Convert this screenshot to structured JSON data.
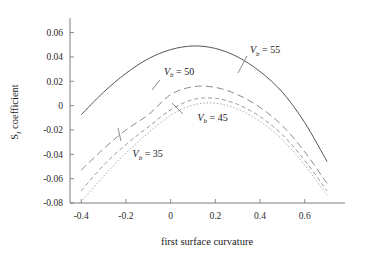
{
  "chart_data": {
    "type": "line",
    "title": "",
    "xlabel": "first surface curvature",
    "ylabel": "S₁ coefficient",
    "xlim": [
      -0.45,
      0.78
    ],
    "ylim": [
      -0.08,
      0.072
    ],
    "xticks": [
      -0.4,
      -0.2,
      0,
      0.2,
      0.4,
      0.6
    ],
    "yticks": [
      0.06,
      0.04,
      0.02,
      0,
      -0.02,
      -0.04,
      -0.06,
      -0.08
    ],
    "xticklabels": [
      "-0.4",
      "-0.2",
      "0",
      "0.2",
      "0.4",
      "0.6"
    ],
    "yticklabels": [
      "0.06",
      "0.04",
      "0.02",
      "0",
      "-0.02",
      "-0.04",
      "-0.06",
      "-0.08"
    ],
    "grid": false,
    "legend": "inline-annotations",
    "series": [
      {
        "name": "Vb = 55",
        "style": "solid",
        "color": "#555555",
        "x": [
          -0.4,
          -0.3,
          -0.2,
          -0.1,
          0.0,
          0.1,
          0.2,
          0.3,
          0.4,
          0.5,
          0.6,
          0.7
        ],
        "y": [
          -0.0075,
          0.011,
          0.0265,
          0.0385,
          0.046,
          0.049,
          0.047,
          0.04,
          0.028,
          0.011,
          -0.014,
          -0.046
        ]
      },
      {
        "name": "Vb = 50",
        "style": "long-dash",
        "color": "#8a8a8a",
        "x": [
          -0.4,
          -0.3,
          -0.2,
          -0.1,
          0.0,
          0.1,
          0.2,
          0.3,
          0.4,
          0.5,
          0.6,
          0.7
        ],
        "y": [
          -0.053,
          -0.0355,
          -0.02,
          -0.0075,
          0.009,
          0.0155,
          0.015,
          0.009,
          -0.0015,
          -0.0165,
          -0.038,
          -0.064
        ]
      },
      {
        "name": "Vb = 45",
        "style": "short-dash",
        "color": "#9a9a9a",
        "x": [
          -0.4,
          -0.3,
          -0.2,
          -0.1,
          0.0,
          0.1,
          0.2,
          0.3,
          0.4,
          0.5,
          0.6,
          0.7
        ],
        "y": [
          -0.07,
          -0.049,
          -0.032,
          -0.0175,
          -0.0035,
          0.005,
          0.006,
          0.001,
          -0.009,
          -0.024,
          -0.045,
          -0.07
        ]
      },
      {
        "name": "Vb = 35",
        "style": "dotted",
        "color": "#a8a8a8",
        "x": [
          -0.4,
          -0.3,
          -0.2,
          -0.1,
          0.0,
          0.1,
          0.2,
          0.3,
          0.4,
          0.5,
          0.6,
          0.7
        ],
        "y": [
          -0.079,
          -0.058,
          -0.039,
          -0.0225,
          -0.008,
          0.0005,
          0.002,
          -0.003,
          -0.013,
          -0.028,
          -0.049,
          -0.0735
        ]
      }
    ],
    "annotations": [
      {
        "id": "lbl55",
        "var": "V",
        "sub": "b",
        "eq": "= 55",
        "x": 0.355,
        "y": 0.043
      },
      {
        "id": "lbl50",
        "var": "V",
        "sub": "b",
        "eq": "= 50",
        "x": -0.03,
        "y": 0.0255
      },
      {
        "id": "lbl45",
        "var": "V",
        "sub": "b",
        "eq": "= 45",
        "x": 0.12,
        "y": -0.0125
      },
      {
        "id": "lbl35",
        "var": "V",
        "sub": "b",
        "eq": "= 35",
        "x": -0.17,
        "y": -0.0425
      }
    ]
  },
  "axes": {
    "x_title": "first surface curvature",
    "y_title_main": "S",
    "y_title_sub": "I",
    "y_title_rest": " coefficient"
  }
}
